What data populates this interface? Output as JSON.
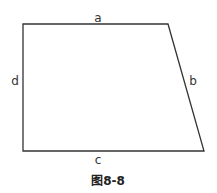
{
  "figure": {
    "type": "quadrilateral (right trapezoid)",
    "vertices": {
      "top_left": [
        23,
        24
      ],
      "top_right": [
        168,
        24
      ],
      "bottom_right": [
        204,
        151
      ],
      "bottom_left": [
        23,
        151
      ]
    },
    "stroke_color": "#333333",
    "sides": {
      "top": "a",
      "right": "b",
      "bottom": "c",
      "left": "d"
    },
    "caption": "图8-8"
  }
}
